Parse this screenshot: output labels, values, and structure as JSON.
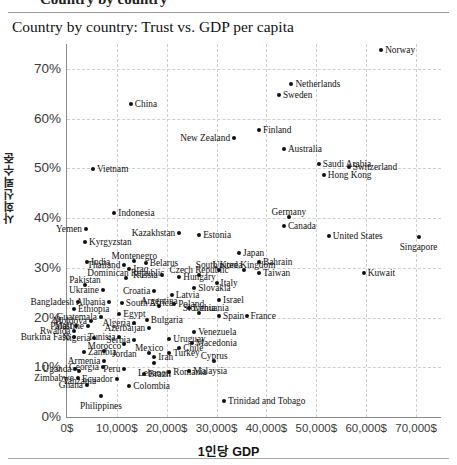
{
  "page": {
    "clipped_header": "Country by country",
    "title": "Country by country: Trust vs. GDP per capita"
  },
  "chart_data": {
    "type": "scatter",
    "title": "Country by country: Trust vs. GDP per capita",
    "xlabel": "1인당 GDP",
    "ylabel": "사회신뢰수준",
    "xlim": [
      0,
      75000
    ],
    "ylim": [
      0,
      75
    ],
    "grid": true,
    "legend": "none",
    "xticks": [
      "0$",
      "10,000$",
      "20,000$",
      "30,000$",
      "40,000$",
      "50,000$",
      "60,000$",
      "70,000$"
    ],
    "xtick_values": [
      0,
      10000,
      20000,
      30000,
      40000,
      50000,
      60000,
      70000
    ],
    "yticks": [
      "0%",
      "10%",
      "20%",
      "30%",
      "40%",
      "50%",
      "60%",
      "70%"
    ],
    "ytick_values": [
      0,
      10,
      20,
      30,
      40,
      50,
      60,
      70
    ],
    "point_color": "#111111",
    "points": [
      {
        "name": "Norway",
        "x": 63000,
        "y": 73.7,
        "pos": "r"
      },
      {
        "name": "Netherlands",
        "x": 45000,
        "y": 67.0,
        "pos": "r"
      },
      {
        "name": "Sweden",
        "x": 42500,
        "y": 64.8,
        "pos": "r"
      },
      {
        "name": "China",
        "x": 12800,
        "y": 63.0,
        "pos": "r"
      },
      {
        "name": "Finland",
        "x": 38500,
        "y": 57.8,
        "pos": "r"
      },
      {
        "name": "New Zealand",
        "x": 33500,
        "y": 56.0,
        "pos": "l"
      },
      {
        "name": "Australia",
        "x": 43500,
        "y": 53.8,
        "pos": "r"
      },
      {
        "name": "Switzerland",
        "x": 56500,
        "y": 50.2,
        "pos": "r"
      },
      {
        "name": "Saudi Arabia",
        "x": 50500,
        "y": 50.9,
        "pos": "r"
      },
      {
        "name": "Hong Kong",
        "x": 51500,
        "y": 48.6,
        "pos": "r"
      },
      {
        "name": "Vietnam",
        "x": 5200,
        "y": 49.8,
        "pos": "r"
      },
      {
        "name": "Indonesia",
        "x": 9500,
        "y": 41.0,
        "pos": "r"
      },
      {
        "name": "Germany",
        "x": 44500,
        "y": 40.2,
        "pos": "t"
      },
      {
        "name": "Canada",
        "x": 43500,
        "y": 38.5,
        "pos": "r"
      },
      {
        "name": "Yemen",
        "x": 3800,
        "y": 37.8,
        "pos": "l"
      },
      {
        "name": "Kazakhstan",
        "x": 22500,
        "y": 37.0,
        "pos": "l"
      },
      {
        "name": "Estonia",
        "x": 26500,
        "y": 36.5,
        "pos": "r"
      },
      {
        "name": "United States",
        "x": 52500,
        "y": 36.3,
        "pos": "r"
      },
      {
        "name": "Singapore",
        "x": 70500,
        "y": 36.2,
        "pos": "b"
      },
      {
        "name": "Kyrgyzstan",
        "x": 3600,
        "y": 35.1,
        "pos": "r"
      },
      {
        "name": "Japan",
        "x": 34500,
        "y": 33.0,
        "pos": "r"
      },
      {
        "name": "India",
        "x": 4000,
        "y": 31.2,
        "pos": "r"
      },
      {
        "name": "Thailand",
        "x": 11500,
        "y": 30.6,
        "pos": "l"
      },
      {
        "name": "Montenegro",
        "x": 13500,
        "y": 31.3,
        "pos": "t"
      },
      {
        "name": "Belarus",
        "x": 15800,
        "y": 30.9,
        "pos": "r"
      },
      {
        "name": "Bahrain",
        "x": 38500,
        "y": 31.2,
        "pos": "r"
      },
      {
        "name": "South Korea",
        "x": 30500,
        "y": 29.5,
        "pos": "t"
      },
      {
        "name": "United Kingdom",
        "x": 35500,
        "y": 29.5,
        "pos": "t"
      },
      {
        "name": "Taiwan",
        "x": 38500,
        "y": 29.0,
        "pos": "r"
      },
      {
        "name": "Kuwait",
        "x": 59500,
        "y": 29.0,
        "pos": "r"
      },
      {
        "name": "Czech Republic",
        "x": 26500,
        "y": 28.5,
        "pos": "t"
      },
      {
        "name": "Hungary",
        "x": 22500,
        "y": 28.1,
        "pos": "r"
      },
      {
        "name": "Russia",
        "x": 19000,
        "y": 28.5,
        "pos": "l"
      },
      {
        "name": "Iraq",
        "x": 12500,
        "y": 29.7,
        "pos": "r"
      },
      {
        "name": "Dominican Republic",
        "x": 11800,
        "y": 28.0,
        "pos": "t"
      },
      {
        "name": "Pakistan",
        "x": 3600,
        "y": 26.5,
        "pos": "t"
      },
      {
        "name": "Italy",
        "x": 30000,
        "y": 27.0,
        "pos": "r"
      },
      {
        "name": "Slovakia",
        "x": 25500,
        "y": 26.0,
        "pos": "r"
      },
      {
        "name": "Ukraine",
        "x": 7200,
        "y": 25.5,
        "pos": "l"
      },
      {
        "name": "Croatia",
        "x": 17500,
        "y": 25.3,
        "pos": "l"
      },
      {
        "name": "Latvia",
        "x": 21000,
        "y": 24.5,
        "pos": "r"
      },
      {
        "name": "Israel",
        "x": 30500,
        "y": 23.5,
        "pos": "r"
      },
      {
        "name": "Bangladesh",
        "x": 2200,
        "y": 23.2,
        "pos": "l"
      },
      {
        "name": "Albania",
        "x": 8500,
        "y": 23.1,
        "pos": "l"
      },
      {
        "name": "South Africa",
        "x": 11000,
        "y": 23.0,
        "pos": "r"
      },
      {
        "name": "Poland",
        "x": 21500,
        "y": 22.7,
        "pos": "r"
      },
      {
        "name": "Argentina",
        "x": 18500,
        "y": 22.3,
        "pos": "t"
      },
      {
        "name": "Lithuania",
        "x": 24500,
        "y": 22.0,
        "pos": "r"
      },
      {
        "name": "Ethiopia",
        "x": 1400,
        "y": 21.8,
        "pos": "r"
      },
      {
        "name": "Slovenia",
        "x": 26500,
        "y": 21.0,
        "pos": "t"
      },
      {
        "name": "Spain",
        "x": 30500,
        "y": 20.4,
        "pos": "r"
      },
      {
        "name": "France",
        "x": 36000,
        "y": 20.3,
        "pos": "r"
      },
      {
        "name": "Guatemala",
        "x": 6800,
        "y": 20.2,
        "pos": "l"
      },
      {
        "name": "Egypt",
        "x": 10500,
        "y": 20.8,
        "pos": "r"
      },
      {
        "name": "Bulgaria",
        "x": 16000,
        "y": 19.6,
        "pos": "r"
      },
      {
        "name": "Moldova",
        "x": 4800,
        "y": 19.4,
        "pos": "l"
      },
      {
        "name": "Algeria",
        "x": 13500,
        "y": 19.0,
        "pos": "l"
      },
      {
        "name": "Mali",
        "x": 1800,
        "y": 18.3,
        "pos": "l"
      },
      {
        "name": "Palestine",
        "x": 4200,
        "y": 18.2,
        "pos": "l"
      },
      {
        "name": "Azerbaijan",
        "x": 16500,
        "y": 17.8,
        "pos": "l"
      },
      {
        "name": "Rwanda",
        "x": 1500,
        "y": 17.2,
        "pos": "l"
      },
      {
        "name": "Venezuela",
        "x": 25500,
        "y": 17.0,
        "pos": "r"
      },
      {
        "name": "Burkina Faso",
        "x": 1500,
        "y": 16.1,
        "pos": "l"
      },
      {
        "name": "Nigeria",
        "x": 5500,
        "y": 15.8,
        "pos": "l"
      },
      {
        "name": "Tunisia",
        "x": 10500,
        "y": 16.0,
        "pos": "l"
      },
      {
        "name": "Serbia",
        "x": 13500,
        "y": 15.4,
        "pos": "l"
      },
      {
        "name": "Uruguay",
        "x": 20500,
        "y": 15.6,
        "pos": "r"
      },
      {
        "name": "Macedonia",
        "x": 25000,
        "y": 14.9,
        "pos": "r"
      },
      {
        "name": "Jordan",
        "x": 11500,
        "y": 14.6,
        "pos": "b"
      },
      {
        "name": "Chile",
        "x": 22500,
        "y": 13.8,
        "pos": "r"
      },
      {
        "name": "Zambia",
        "x": 3400,
        "y": 13.0,
        "pos": "r"
      },
      {
        "name": "Morocco",
        "x": 7500,
        "y": 13.2,
        "pos": "t"
      },
      {
        "name": "Mexico",
        "x": 16500,
        "y": 12.8,
        "pos": "t"
      },
      {
        "name": "Turkey",
        "x": 20500,
        "y": 12.9,
        "pos": "r"
      },
      {
        "name": "Iran",
        "x": 17500,
        "y": 12.0,
        "pos": "r"
      },
      {
        "name": "Cyprus",
        "x": 29500,
        "y": 11.2,
        "pos": "t"
      },
      {
        "name": "Armenia",
        "x": 7500,
        "y": 11.3,
        "pos": "l"
      },
      {
        "name": "Lebanon",
        "x": 17500,
        "y": 10.9,
        "pos": "b"
      },
      {
        "name": "Georgia",
        "x": 7200,
        "y": 10.0,
        "pos": "l"
      },
      {
        "name": "Uganda",
        "x": 1700,
        "y": 9.7,
        "pos": "l"
      },
      {
        "name": "Tanzania",
        "x": 2500,
        "y": 9.3,
        "pos": "b"
      },
      {
        "name": "Peru",
        "x": 11500,
        "y": 9.6,
        "pos": "l"
      },
      {
        "name": "Malaysia",
        "x": 24500,
        "y": 9.2,
        "pos": "r"
      },
      {
        "name": "Romania",
        "x": 20500,
        "y": 9.0,
        "pos": "r"
      },
      {
        "name": "Brazil",
        "x": 15500,
        "y": 8.6,
        "pos": "r"
      },
      {
        "name": "Zimbabwe",
        "x": 2200,
        "y": 7.9,
        "pos": "l"
      },
      {
        "name": "Ecuador",
        "x": 10000,
        "y": 7.6,
        "pos": "l"
      },
      {
        "name": "Ghana",
        "x": 4000,
        "y": 6.5,
        "pos": "l"
      },
      {
        "name": "Colombia",
        "x": 12500,
        "y": 6.3,
        "pos": "r"
      },
      {
        "name": "Philippines",
        "x": 6800,
        "y": 4.3,
        "pos": "b"
      },
      {
        "name": "Trinidad and Tobago",
        "x": 31500,
        "y": 3.3,
        "pos": "r"
      }
    ]
  }
}
